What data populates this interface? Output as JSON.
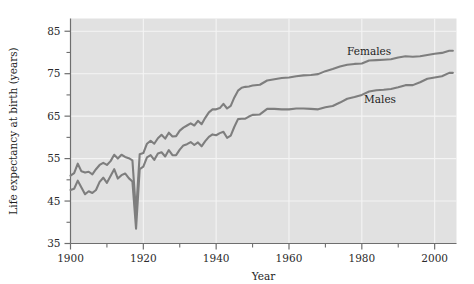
{
  "chart_data": {
    "type": "line",
    "title": "",
    "xlabel": "Year",
    "ylabel": "Life expectancy at birth (years)",
    "xlim": [
      1900,
      2006
    ],
    "ylim": [
      35,
      88
    ],
    "grid": true,
    "legend_position": "inline-annotation",
    "x_ticks_major": [
      1900,
      1920,
      1940,
      1960,
      1980,
      2000
    ],
    "x_tick_labels": [
      "1900",
      "1920",
      "1940",
      "1960",
      "1980",
      "2000"
    ],
    "x_ticks_minor": [
      1910,
      1930,
      1950,
      1970,
      1990
    ],
    "y_ticks_major": [
      35,
      45,
      55,
      65,
      75,
      85
    ],
    "y_tick_labels": [
      "35",
      "45",
      "55",
      "65",
      "75",
      "85"
    ],
    "y_ticks_minor": [
      40,
      50,
      60,
      70,
      80
    ],
    "annotations": [
      {
        "text": "Females",
        "x": 1982,
        "y": 79.5
      },
      {
        "text": "Males",
        "x": 1985,
        "y": 68.2
      }
    ],
    "series": [
      {
        "name": "Females",
        "color": "#7e7e7e",
        "x": [
          1900,
          1901,
          1902,
          1903,
          1904,
          1905,
          1906,
          1907,
          1908,
          1909,
          1910,
          1911,
          1912,
          1913,
          1914,
          1915,
          1916,
          1917,
          1918,
          1919,
          1920,
          1921,
          1922,
          1923,
          1924,
          1925,
          1926,
          1927,
          1928,
          1929,
          1930,
          1931,
          1932,
          1933,
          1934,
          1935,
          1936,
          1937,
          1938,
          1939,
          1940,
          1941,
          1942,
          1943,
          1944,
          1945,
          1946,
          1947,
          1948,
          1949,
          1950,
          1952,
          1954,
          1956,
          1958,
          1960,
          1962,
          1964,
          1966,
          1968,
          1970,
          1972,
          1974,
          1976,
          1978,
          1980,
          1982,
          1984,
          1986,
          1988,
          1990,
          1992,
          1994,
          1996,
          1998,
          2000,
          2002,
          2004,
          2005
        ],
        "values": [
          51.0,
          51.6,
          53.8,
          52.0,
          51.7,
          51.9,
          51.3,
          52.5,
          53.5,
          54.0,
          53.5,
          54.4,
          55.9,
          55.0,
          55.9,
          55.4,
          55.1,
          54.6,
          42.2,
          56.0,
          56.3,
          58.5,
          59.2,
          58.5,
          59.8,
          60.6,
          59.7,
          61.1,
          60.2,
          60.3,
          61.6,
          62.3,
          62.8,
          63.3,
          62.8,
          63.9,
          63.1,
          64.6,
          65.9,
          66.6,
          66.6,
          66.9,
          67.9,
          66.8,
          67.4,
          69.4,
          71.0,
          71.7,
          71.9,
          72.0,
          72.2,
          72.4,
          73.4,
          73.7,
          74.0,
          74.1,
          74.4,
          74.6,
          74.7,
          74.9,
          75.6,
          76.1,
          76.7,
          77.1,
          77.3,
          77.4,
          78.1,
          78.2,
          78.3,
          78.4,
          78.8,
          79.1,
          79.0,
          79.1,
          79.4,
          79.7,
          79.9,
          80.4,
          80.4
        ]
      },
      {
        "name": "Males",
        "color": "#7e7e7e",
        "x": [
          1900,
          1901,
          1902,
          1903,
          1904,
          1905,
          1906,
          1907,
          1908,
          1909,
          1910,
          1911,
          1912,
          1913,
          1914,
          1915,
          1916,
          1917,
          1918,
          1919,
          1920,
          1921,
          1922,
          1923,
          1924,
          1925,
          1926,
          1927,
          1928,
          1929,
          1930,
          1931,
          1932,
          1933,
          1934,
          1935,
          1936,
          1937,
          1938,
          1939,
          1940,
          1941,
          1942,
          1943,
          1944,
          1945,
          1946,
          1947,
          1948,
          1949,
          1950,
          1952,
          1954,
          1956,
          1958,
          1960,
          1962,
          1964,
          1966,
          1968,
          1970,
          1972,
          1974,
          1976,
          1978,
          1980,
          1982,
          1984,
          1986,
          1988,
          1990,
          1992,
          1994,
          1996,
          1998,
          2000,
          2002,
          2004,
          2005
        ],
        "values": [
          47.6,
          47.9,
          49.8,
          48.2,
          46.6,
          47.3,
          46.9,
          47.6,
          49.5,
          50.5,
          49.3,
          50.9,
          52.5,
          50.3,
          51.1,
          51.5,
          50.4,
          49.6,
          38.5,
          52.5,
          53.1,
          55.3,
          55.8,
          54.7,
          56.2,
          56.5,
          55.5,
          57.0,
          55.8,
          55.8,
          57.1,
          58.1,
          58.4,
          58.9,
          58.2,
          58.8,
          57.9,
          59.1,
          60.1,
          60.7,
          60.5,
          61.0,
          61.3,
          59.9,
          60.4,
          62.5,
          64.3,
          64.4,
          64.4,
          64.9,
          65.3,
          65.4,
          66.7,
          66.7,
          66.6,
          66.6,
          66.8,
          66.8,
          66.7,
          66.6,
          67.1,
          67.4,
          68.2,
          69.1,
          69.5,
          70.0,
          70.8,
          71.1,
          71.2,
          71.4,
          71.8,
          72.3,
          72.3,
          73.0,
          73.8,
          74.1,
          74.4,
          75.2,
          75.2
        ]
      }
    ]
  },
  "axes": {
    "x_title": "Year",
    "y_title": "Life expectancy at birth (years)"
  },
  "colors": {
    "plot_background": "#e1e1e1",
    "gridline": "#f4f4f4",
    "axis": "#6e6e6e",
    "line": "#7e7e7e",
    "text": "#1d1d1d"
  }
}
